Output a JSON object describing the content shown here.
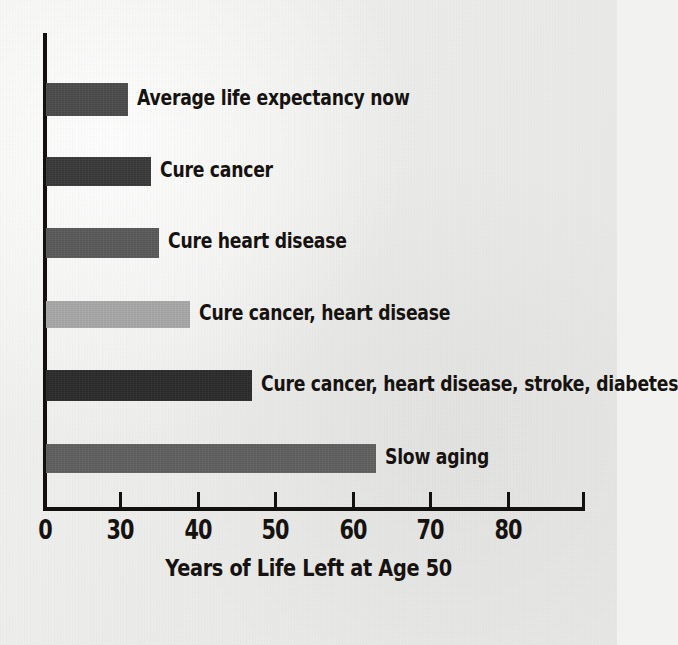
{
  "chart_data": {
    "type": "bar",
    "orientation": "horizontal",
    "title": "",
    "xlabel": "Years of Life Left at Age 50",
    "ylabel": "",
    "categories": [
      "Average life expectancy now",
      "Cure cancer",
      "Cure heart disease",
      "Cure cancer, heart disease",
      "Cure cancer, heart disease, stroke, diabetes",
      "Slow aging"
    ],
    "values": [
      31,
      34,
      35,
      39,
      47,
      63
    ],
    "bar_colors": [
      "#4a4a4a",
      "#383838",
      "#595959",
      "#a8a8a8",
      "#2a2a2a",
      "#5f5f5f"
    ],
    "xlim": [
      0,
      89
    ],
    "xticks": [
      0,
      30,
      40,
      50,
      60,
      70,
      80
    ],
    "xtick_labels": [
      "0",
      "30",
      "40",
      "50",
      "60",
      "70",
      "80"
    ],
    "axis_break_after_zero": true,
    "grid": false,
    "legend": "none",
    "background_color": "#ececea",
    "axis_color": "#14100f"
  },
  "bars": [
    {
      "label": "Average life expectancy now",
      "value": 31,
      "color": "#4a4a4a"
    },
    {
      "label": "Cure cancer",
      "value": 34,
      "color": "#383838"
    },
    {
      "label": "Cure heart disease",
      "value": 35,
      "color": "#595959"
    },
    {
      "label": "Cure cancer, heart disease",
      "value": 39,
      "color": "#a8a8a8"
    },
    {
      "label": "Cure cancer, heart disease, stroke, diabetes",
      "value": 47,
      "color": "#2a2a2a"
    },
    {
      "label": "Slow aging",
      "value": 63,
      "color": "#5f5f5f"
    }
  ],
  "axis": {
    "x_title": "Years of Life Left at Age 50",
    "ticks": [
      {
        "label": "0",
        "value": 0
      },
      {
        "label": "30",
        "value": 30
      },
      {
        "label": "40",
        "value": 40
      },
      {
        "label": "50",
        "value": 50
      },
      {
        "label": "60",
        "value": 60
      },
      {
        "label": "70",
        "value": 70
      },
      {
        "label": "80",
        "value": 80
      }
    ]
  }
}
